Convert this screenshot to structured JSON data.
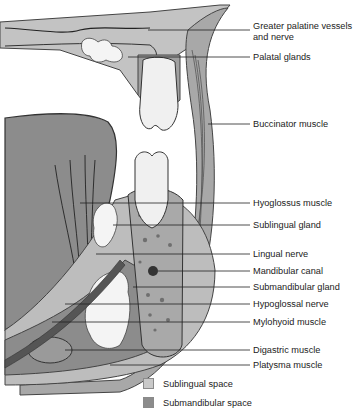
{
  "labels": [
    {
      "text": "Greater palatine vessels\nand nerve",
      "y": 26,
      "line_y": 30,
      "tx": 148
    },
    {
      "text": "Palatal glands",
      "y": 52,
      "line_y": 57,
      "tx": 128
    },
    {
      "text": "Buccinator muscle",
      "y": 119,
      "line_y": 124,
      "tx": 208
    },
    {
      "text": "Hyoglossus muscle",
      "y": 198,
      "line_y": 203,
      "tx": 80
    },
    {
      "text": "Sublingual gland",
      "y": 220,
      "line_y": 225,
      "tx": 113
    },
    {
      "text": "Lingual nerve",
      "y": 249,
      "line_y": 254,
      "tx": 96
    },
    {
      "text": "Mandibular canal",
      "y": 266,
      "line_y": 271,
      "tx": 158
    },
    {
      "text": "Submandibular gland",
      "y": 282,
      "line_y": 287,
      "tx": 133
    },
    {
      "text": "Hypoglossal nerve",
      "y": 299,
      "line_y": 304,
      "tx": 65
    },
    {
      "text": "Mylohyoid muscle",
      "y": 317,
      "line_y": 322,
      "tx": 52
    },
    {
      "text": "Digastric muscle",
      "y": 345,
      "line_y": 350,
      "tx": 65
    },
    {
      "text": "Platysma muscle",
      "y": 361,
      "line_y": 365,
      "tx": 110
    }
  ],
  "legend": [
    {
      "label": "Sublingual space",
      "color": "#c9c9c9",
      "y": 378
    },
    {
      "label": "Submandibular space",
      "color": "#8c8c8c",
      "y": 397
    }
  ],
  "colors": {
    "tongue": "#8c8c8c",
    "soft_tissue": "#b8b8b8",
    "bone": "#a9a9a9",
    "gland": "#f2f2f2",
    "outline": "#333333",
    "leader": "#222222"
  }
}
